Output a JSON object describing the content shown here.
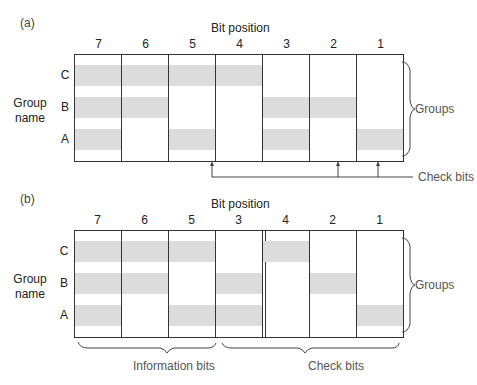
{
  "panels": [
    {
      "id": "a",
      "label": "(a)",
      "axis_title": "Bit position",
      "group_name_line1": "Group",
      "group_name_line2": "name",
      "columns": [
        "7",
        "6",
        "5",
        "4",
        "3",
        "2",
        "1"
      ],
      "rows": [
        {
          "label": "C",
          "shaded": [
            1,
            1,
            1,
            1,
            0,
            0,
            0
          ]
        },
        {
          "label": "B",
          "shaded": [
            1,
            1,
            0,
            0,
            1,
            1,
            0
          ]
        },
        {
          "label": "A",
          "shaded": [
            1,
            0,
            1,
            0,
            1,
            0,
            1
          ]
        }
      ],
      "right_brace_label": "Groups",
      "check_bits_label": "Check bits",
      "check_bit_arrow_columns": [
        "4",
        "2",
        "1"
      ]
    },
    {
      "id": "b",
      "label": "(b)",
      "axis_title": "Bit position",
      "group_name_line1": "Group",
      "group_name_line2": "name",
      "columns": [
        "7",
        "6",
        "5",
        "3",
        "4",
        "2",
        "1"
      ],
      "rows": [
        {
          "label": "C",
          "shaded": [
            1,
            1,
            1,
            0,
            1,
            0,
            0
          ]
        },
        {
          "label": "B",
          "shaded": [
            1,
            1,
            0,
            1,
            0,
            1,
            0
          ]
        },
        {
          "label": "A",
          "shaded": [
            1,
            0,
            1,
            1,
            0,
            0,
            1
          ]
        }
      ],
      "right_brace_label": "Groups",
      "bottom_left_brace_label": "Information bits",
      "bottom_right_brace_label": "Check bits"
    }
  ],
  "colors": {
    "shade": "#dcdcdc",
    "line": "#333333"
  }
}
